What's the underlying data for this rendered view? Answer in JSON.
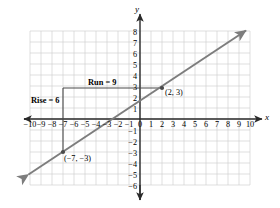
{
  "chart_data": {
    "type": "line",
    "title": "",
    "xlabel": "x",
    "ylabel": "y",
    "grid": true,
    "legend": false,
    "xlim": [
      -10,
      10
    ],
    "ylim": [
      -6,
      8
    ],
    "x_ticks": [
      "-10",
      "-9",
      "-8",
      "-7",
      "-6",
      "-5",
      "-4",
      "-3",
      "-2",
      "-1",
      "0",
      "1",
      "2",
      "3",
      "4",
      "5",
      "6",
      "7",
      "8",
      "9",
      "10"
    ],
    "y_ticks": [
      "8",
      "7",
      "6",
      "5",
      "4",
      "3",
      "2",
      "1",
      "-1",
      "-2",
      "-3",
      "-4",
      "-5",
      "-6"
    ],
    "series": [
      {
        "name": "line",
        "slope": 0.6667,
        "intercept": 1.6667,
        "equation": "y = (2/3)x + 5/3",
        "x_endpoints": [
          -10.1,
          9.6
        ],
        "y_endpoints": [
          -5.07,
          8.07
        ],
        "color": "#7d7d7d",
        "arrows_both_ends": true
      }
    ],
    "points": [
      {
        "label": "(2, 3)",
        "x": 2,
        "y": 3
      },
      {
        "label": "(−7, −3)",
        "x": -7,
        "y": -3
      }
    ],
    "annotations": [
      {
        "label": "Run = 9",
        "kind": "run",
        "value": 9,
        "from": [
          -7,
          3
        ],
        "to": [
          2,
          3
        ]
      },
      {
        "label": "Rise = 6",
        "kind": "rise",
        "value": 6,
        "from": [
          -7,
          -3
        ],
        "to": [
          -7,
          3
        ]
      }
    ]
  },
  "axes": {
    "x_axis_label": "x",
    "y_axis_label": "y"
  },
  "labels": {
    "run": "Run = 9",
    "rise": "Rise = 6",
    "point_upper": "(2, 3)",
    "point_lower": "(−7, −3)"
  },
  "x_tick_labels": [
    {
      "t": "−10",
      "px": 30
    },
    {
      "t": "−9",
      "px": 41
    },
    {
      "t": "−8",
      "px": 52
    },
    {
      "t": "−7",
      "px": 63
    },
    {
      "t": "−6",
      "px": 74
    },
    {
      "t": "−5",
      "px": 85
    },
    {
      "t": "−4",
      "px": 96
    },
    {
      "t": "−3",
      "px": 107
    },
    {
      "t": "−2",
      "px": 118
    },
    {
      "t": "−1",
      "px": 129
    },
    {
      "t": "0",
      "px": 140
    },
    {
      "t": "1",
      "px": 151
    },
    {
      "t": "2",
      "px": 162
    },
    {
      "t": "3",
      "px": 173
    },
    {
      "t": "4",
      "px": 184
    },
    {
      "t": "5",
      "px": 195
    },
    {
      "t": "6",
      "px": 206
    },
    {
      "t": "7",
      "px": 217
    },
    {
      "t": "8",
      "px": 228
    },
    {
      "t": "9",
      "px": 239
    },
    {
      "t": "10",
      "px": 250
    }
  ],
  "y_tick_labels": [
    {
      "t": "8",
      "py": 33
    },
    {
      "t": "7",
      "py": 44
    },
    {
      "t": "6",
      "py": 55
    },
    {
      "t": "5",
      "py": 66
    },
    {
      "t": "4",
      "py": 77
    },
    {
      "t": "3",
      "py": 88
    },
    {
      "t": "2",
      "py": 99
    },
    {
      "t": "1",
      "py": 110
    },
    {
      "t": "−1",
      "py": 132
    },
    {
      "t": "−2",
      "py": 143
    },
    {
      "t": "−3",
      "py": 154
    },
    {
      "t": "−4",
      "py": 165
    },
    {
      "t": "−5",
      "py": 176
    },
    {
      "t": "−6",
      "py": 187
    }
  ]
}
